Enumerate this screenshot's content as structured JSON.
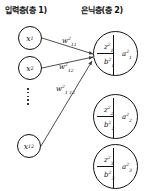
{
  "titles": {
    "input_layer": "입력층(층 1)",
    "hidden_layer": "은닉층(층 2)"
  },
  "input_nodes": [
    {
      "label": "x",
      "sub": "1"
    },
    {
      "label": "x",
      "sub": "2"
    },
    {
      "label": "x",
      "sub": "12"
    }
  ],
  "weights": [
    {
      "base": "w",
      "sup": "2",
      "sub": "11"
    },
    {
      "base": "w",
      "sup": "2",
      "sub": "12"
    },
    {
      "base": "w",
      "sup": "2",
      "sub": "1 12"
    }
  ],
  "hidden_nodes": [
    {
      "z": "z",
      "z_sup": "2",
      "z_sub": "1",
      "b": "b",
      "b_sup": "2",
      "b_sub": "1",
      "a": "a",
      "a_sup": "2",
      "a_sub": "1"
    },
    {
      "z": "z",
      "z_sup": "2",
      "z_sub": "2",
      "b": "b",
      "b_sup": "2",
      "b_sub": "2",
      "a": "a",
      "a_sup": "2",
      "a_sub": "2"
    },
    {
      "z": "z",
      "z_sup": "2",
      "z_sub": "3",
      "b": "b",
      "b_sup": "2",
      "b_sub": "3",
      "a": "a",
      "a_sup": "2",
      "a_sub": "3"
    }
  ],
  "ellipsis_dot_count": 5,
  "colors": {
    "stroke": "#111111",
    "background": "#ffffff"
  }
}
